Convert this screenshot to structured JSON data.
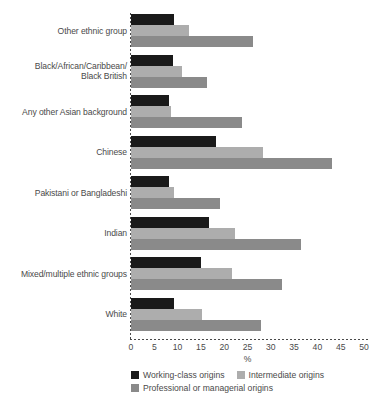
{
  "chart_data": {
    "type": "bar",
    "orientation": "horizontal",
    "title": "",
    "xlabel": "%",
    "ylabel": "",
    "xlim": [
      0,
      50
    ],
    "xticks": [
      0,
      5,
      10,
      15,
      20,
      25,
      30,
      35,
      40,
      45,
      50
    ],
    "grid": false,
    "legend_position": "bottom",
    "categories": [
      "Other ethnic group",
      "Black/African/Caribbean/\nBlack British",
      "Any other Asian background",
      "Chinese",
      "Pakistani or Bangladeshi",
      "Indian",
      "Mixed/multiple ethnic groups",
      "White"
    ],
    "series": [
      {
        "name": "Working-class origins",
        "color": "#1a1a1a",
        "values": [
          9.2,
          9.1,
          8.1,
          18.2,
          8.1,
          16.7,
          15.0,
          9.3
        ]
      },
      {
        "name": "Intermediate origins",
        "color": "#adadad",
        "values": [
          12.5,
          11.0,
          8.6,
          28.4,
          9.2,
          22.3,
          21.7,
          15.2
        ]
      },
      {
        "name": "Professional or managerial origins",
        "color": "#8a8a8a",
        "values": [
          26.2,
          16.4,
          23.8,
          43.2,
          19.0,
          36.5,
          32.3,
          28.0
        ]
      }
    ]
  },
  "axis": {
    "x_title": "%",
    "tick_labels": [
      "0",
      "5",
      "10",
      "15",
      "20",
      "25",
      "30",
      "35",
      "40",
      "45",
      "50"
    ]
  },
  "legend": {
    "items": [
      {
        "label": "Working-class origins",
        "color": "#1a1a1a"
      },
      {
        "label": "Intermediate origins",
        "color": "#adadad"
      },
      {
        "label": "Professional or managerial origins",
        "color": "#8a8a8a"
      }
    ]
  },
  "category_labels": [
    {
      "lines": [
        "Other ethnic group"
      ]
    },
    {
      "lines": [
        "Black/African/Caribbean/",
        "Black British"
      ]
    },
    {
      "lines": [
        "Any other Asian background"
      ]
    },
    {
      "lines": [
        "Chinese"
      ]
    },
    {
      "lines": [
        "Pakistani or Bangladeshi"
      ]
    },
    {
      "lines": [
        "Indian"
      ]
    },
    {
      "lines": [
        "Mixed/multiple ethnic groups"
      ]
    },
    {
      "lines": [
        "White"
      ]
    }
  ]
}
